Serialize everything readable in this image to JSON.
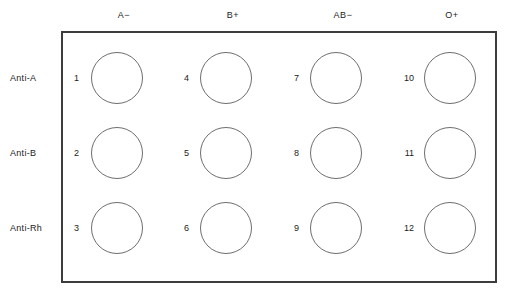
{
  "diagram": {
    "colors": {
      "plate_border": "#3c3c3c",
      "well_stroke": "#6e6e72",
      "background": "#ffffff",
      "text": "#1c1c1c"
    },
    "column_headers": [
      {
        "label": "A−",
        "x": 124
      },
      {
        "label": "B+",
        "x": 233
      },
      {
        "label": "AB−",
        "x": 343
      },
      {
        "label": "O+",
        "x": 452
      }
    ],
    "row_labels": [
      {
        "label": "Anti-A",
        "y": 78
      },
      {
        "label": "Anti-B",
        "y": 153
      },
      {
        "label": "Anti-Rh",
        "y": 228
      }
    ],
    "wells": [
      {
        "number": "1",
        "cx": 117,
        "cy": 78,
        "num_x": 79,
        "num_y": 78
      },
      {
        "number": "4",
        "cx": 226,
        "cy": 78,
        "num_x": 189,
        "num_y": 78
      },
      {
        "number": "7",
        "cx": 336,
        "cy": 78,
        "num_x": 299,
        "num_y": 78
      },
      {
        "number": "10",
        "cx": 450,
        "cy": 78,
        "num_x": 414,
        "num_y": 78
      },
      {
        "number": "2",
        "cx": 117,
        "cy": 153,
        "num_x": 79,
        "num_y": 153
      },
      {
        "number": "5",
        "cx": 226,
        "cy": 153,
        "num_x": 189,
        "num_y": 153
      },
      {
        "number": "8",
        "cx": 336,
        "cy": 153,
        "num_x": 299,
        "num_y": 153
      },
      {
        "number": "11",
        "cx": 450,
        "cy": 153,
        "num_x": 414,
        "num_y": 153
      },
      {
        "number": "3",
        "cx": 117,
        "cy": 228,
        "num_x": 79,
        "num_y": 228
      },
      {
        "number": "6",
        "cx": 226,
        "cy": 228,
        "num_x": 189,
        "num_y": 228
      },
      {
        "number": "9",
        "cx": 336,
        "cy": 228,
        "num_x": 299,
        "num_y": 228
      },
      {
        "number": "12",
        "cx": 450,
        "cy": 228,
        "num_x": 414,
        "num_y": 228
      }
    ],
    "caption": ""
  }
}
